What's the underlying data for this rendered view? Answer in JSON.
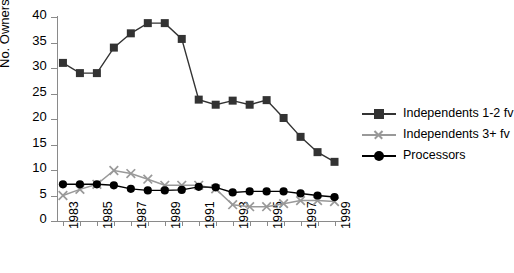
{
  "chart_data": {
    "type": "line",
    "title": "",
    "xlabel": "",
    "ylabel": "No. Owners",
    "ylim": [
      0,
      40
    ],
    "ytick_values": [
      0,
      5,
      10,
      15,
      20,
      25,
      30,
      35,
      40
    ],
    "ytick_labels": [
      "0",
      "5",
      "10",
      "15",
      "20",
      "25",
      "30",
      "35",
      "40"
    ],
    "xlim": [
      1983,
      1999
    ],
    "x": [
      1983,
      1984,
      1985,
      1986,
      1987,
      1988,
      1989,
      1990,
      1991,
      1992,
      1993,
      1994,
      1995,
      1996,
      1997,
      1998,
      1999
    ],
    "xtick_labels": [
      "1983",
      "",
      "1985",
      "",
      "1987",
      "",
      "1989",
      "",
      "1991",
      "",
      "1993",
      "",
      "1995",
      "",
      "1997",
      "",
      "1999"
    ],
    "xtick_labels_shown": [
      "1983",
      "1985",
      "1987",
      "1989",
      "1991",
      "1993",
      "1995",
      "1997",
      "1999"
    ],
    "grid": false,
    "legend_position": "right",
    "series": [
      {
        "name": "Independents 1-2 fv",
        "marker": "square",
        "color": "#333333",
        "values": [
          31,
          29,
          29,
          34,
          36.8,
          38.8,
          38.8,
          35.7,
          23.8,
          22.8,
          23.6,
          22.8,
          23.7,
          20.2,
          16.5,
          13.5,
          11.6
        ]
      },
      {
        "name": "Independents 3+ fv",
        "marker": "x",
        "color": "#999999",
        "values": [
          5,
          6.2,
          7.2,
          9.9,
          9.3,
          8.2,
          7,
          7,
          7,
          6.3,
          3.2,
          2.8,
          2.8,
          3.4,
          4,
          4,
          3.8
        ]
      },
      {
        "name": "Processors",
        "marker": "circle",
        "color": "#000000",
        "values": [
          7.2,
          7.2,
          7.2,
          7,
          6.3,
          6,
          6,
          6.1,
          6.7,
          6.6,
          5.6,
          5.8,
          5.8,
          5.8,
          5.4,
          5,
          4.7
        ]
      }
    ]
  },
  "legend": {
    "items": [
      {
        "label": "Independents 1-2 fv",
        "marker": "square",
        "color": "#333333"
      },
      {
        "label": "Independents 3+ fv",
        "marker": "x",
        "color": "#999999"
      },
      {
        "label": "Processors",
        "marker": "circle",
        "color": "#000000"
      }
    ]
  }
}
